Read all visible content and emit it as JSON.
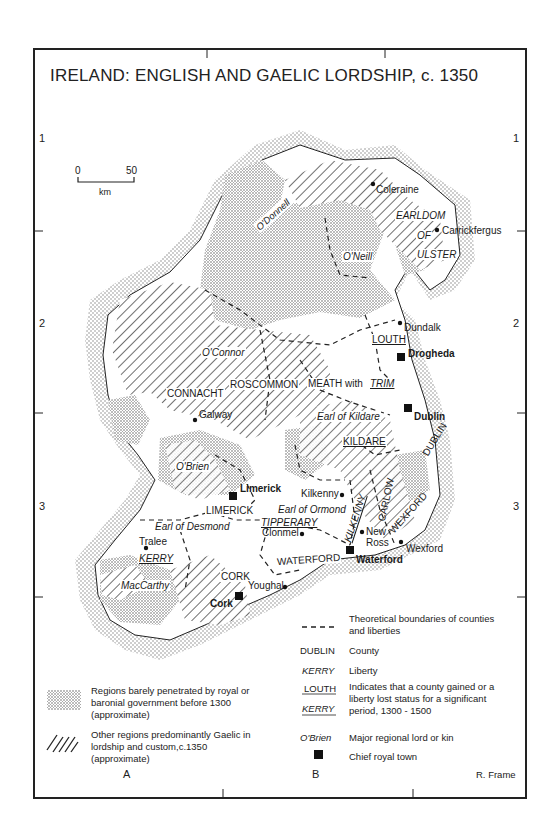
{
  "title": "IRELAND: ENGLISH AND GAELIC LORDSHIP, c. 1350",
  "scale_bar": {
    "start": "0",
    "end": "50",
    "unit": "km"
  },
  "grid": {
    "rows": [
      "1",
      "2",
      "3"
    ],
    "columns": [
      "A",
      "B"
    ]
  },
  "credit": "R. Frame",
  "colors": {
    "frame": "#222222",
    "stipple": "#9a9a9a",
    "hatch": "#2a2a2a",
    "background": "#ffffff"
  },
  "labels": {
    "lords": [
      "O'Donnell",
      "O'Neill",
      "O'Connor",
      "O'Brien",
      "MacCarthy",
      "Earl of Kildare",
      "Earl of Ormond",
      "Earl of Desmond"
    ],
    "counties": [
      "CONNACHT",
      "ROSCOMMON",
      "MEATH with",
      "LIMERICK",
      "CORK",
      "WATERFORD",
      "DUBLIN",
      "WEXFORD",
      "CARLOW"
    ],
    "county_gained": [
      "LOUTH",
      "KILDARE"
    ],
    "liberty_lost": [
      "TRIM",
      "TIPPERARY",
      "KERRY",
      "KILKENNY"
    ],
    "liberty": [
      "EARLDOM",
      "OF",
      "ULSTER"
    ],
    "towns": [
      "Coleraine",
      "Carrickfergus",
      "Dundalk",
      "Galway",
      "Kilkenny",
      "Clonmel",
      "New",
      "Ross",
      "Wexford",
      "Tralee",
      "Youghal"
    ],
    "chief_towns": [
      "Drogheda",
      "Dublin",
      "Limerick",
      "Waterford",
      "Cork"
    ]
  },
  "legend": {
    "stipple": "Regions barely penetrated by royal or baronial government before 1300 (approximate)",
    "stipple_lines": [
      "Regions barely penetrated by royal or",
      "baronial government  before 1300",
      "(approximate)"
    ],
    "hatch_lines": [
      "Other regions predominantly Gaelic in",
      "lordship and custom,c.1350",
      "(approximate)"
    ],
    "boundary_key": "– – –",
    "boundary_lines": [
      "Theoretical boundaries of counties",
      "and liberties"
    ],
    "county_key": "DUBLIN",
    "county_desc": "County",
    "liberty_key": "KERRY",
    "liberty_desc": "Liberty",
    "status_key_1": "LOUTH",
    "status_key_2": "KERRY",
    "status_lines": [
      "Indicates that a county gained or a",
      "liberty lost status for a significant",
      "period, 1300 - 1500"
    ],
    "lord_key": "O'Brien",
    "lord_desc": "Major regional lord or kin",
    "town_desc": "Chief royal town"
  }
}
